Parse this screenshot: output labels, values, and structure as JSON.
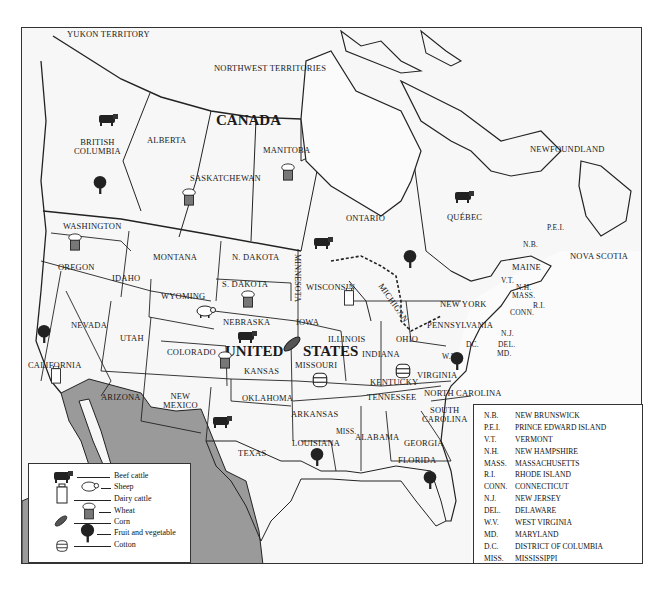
{
  "map": {
    "title": "North America agricultural products map",
    "country_labels": {
      "canada": "CANADA",
      "united": "UNITED",
      "states": "STATES"
    },
    "canada_regions": {
      "yukon": "YUKON\nTERRITORY",
      "nwt": "NORTHWEST TERRITORIES",
      "bc": "BRITISH\nCOLUMBIA",
      "alberta": "ALBERTA",
      "saskatchewan": "SASKATCHEWAN",
      "manitoba": "MANITOBA",
      "ontario": "ONTARIO",
      "quebec": "QUÉBEC",
      "newfoundland": "NEWFOUNDLAND",
      "nb": "N.B.",
      "pei": "P.E.I.",
      "nova_scotia": "NOVA SCOTIA"
    },
    "us_states": {
      "washington": "WASHINGTON",
      "oregon": "OREGON",
      "idaho": "IDAHO",
      "montana": "MONTANA",
      "ndakota": "N. DAKOTA",
      "sdakota": "S. DAKOTA",
      "minnesota": "MINNESOTA",
      "wisconsin": "WISCONSIN",
      "michigan": "MICHIGAN",
      "wyoming": "WYOMING",
      "nebraska": "NEBRASKA",
      "iowa": "IOWA",
      "illinois": "ILLINOIS",
      "indiana": "INDIANA",
      "ohio": "OHIO",
      "pennsylvania": "PENNSYLVANIA",
      "newyork": "NEW YORK",
      "maine": "MAINE",
      "vt": "V.T.",
      "nh": "N.H.",
      "mass": "MASS.",
      "ri": "R.I.",
      "conn": "CONN.",
      "nj": "N.J.",
      "del": "DEL.",
      "md": "MD.",
      "dc": "DC.",
      "wv": "W.V.",
      "virginia": "VIRGINIA",
      "kentucky": "KENTUCKY",
      "tennessee": "TENNESSEE",
      "ncarolina": "NORTH CAROLINA",
      "scarolina": "SOUTH\nCAROLINA",
      "georgia": "GEORGIA",
      "florida": "FLORIDA",
      "alabama": "ALABAMA",
      "miss": "MISS.",
      "louisiana": "LOUISIANA",
      "arkansas": "ARKANSAS",
      "missouri": "MISSOURI",
      "kansas": "KANSAS",
      "oklahoma": "OKLAHOMA",
      "texas": "TEXAS",
      "colorado": "COLORADO",
      "utah": "UTAH",
      "nevada": "NEVADA",
      "california": "CALIFORNIA",
      "arizona": "ARIZONA",
      "newmexico": "NEW\nMEXICO"
    },
    "colors": {
      "land": "#f7f7f7",
      "mexico": "#9a9a9a",
      "border": "#222222",
      "frame": "#333333"
    }
  },
  "legend": {
    "items": [
      {
        "icon": "beef-cattle-icon",
        "label": "Beef cattle"
      },
      {
        "icon": "sheep-icon",
        "label": "Sheep"
      },
      {
        "icon": "dairy-cattle-icon",
        "label": "Dairy cattle"
      },
      {
        "icon": "wheat-icon",
        "label": "Wheat"
      },
      {
        "icon": "corn-icon",
        "label": "Corn"
      },
      {
        "icon": "fruit-vegetable-icon",
        "label": "Fruit and vegetable"
      },
      {
        "icon": "cotton-icon",
        "label": "Cotton"
      }
    ]
  },
  "abbreviations": [
    {
      "abbr": "N.B.",
      "name": "NEW BRUNSWICK"
    },
    {
      "abbr": "P.E.I.",
      "name": "PRINCE EDWARD ISLAND"
    },
    {
      "abbr": "V.T.",
      "name": "VERMONT"
    },
    {
      "abbr": "N.H.",
      "name": "NEW HAMPSHIRE"
    },
    {
      "abbr": "MASS.",
      "name": "MASSACHUSETTS"
    },
    {
      "abbr": "R.I.",
      "name": "RHODE ISLAND"
    },
    {
      "abbr": "CONN.",
      "name": "CONNECTICUT"
    },
    {
      "abbr": "N.J.",
      "name": "NEW JERSEY"
    },
    {
      "abbr": "DEL.",
      "name": "DELAWARE"
    },
    {
      "abbr": "W.V.",
      "name": "WEST VIRGINIA"
    },
    {
      "abbr": "MD.",
      "name": "MARYLAND"
    },
    {
      "abbr": "D.C.",
      "name": "DISTRICT OF COLUMBIA"
    },
    {
      "abbr": "MISS.",
      "name": "MISSISSIPPI"
    }
  ],
  "product_markers": [
    {
      "type": "beef-cattle",
      "region": "British Columbia"
    },
    {
      "type": "fruit-vegetable",
      "region": "British Columbia"
    },
    {
      "type": "wheat",
      "region": "Saskatchewan"
    },
    {
      "type": "wheat",
      "region": "Manitoba"
    },
    {
      "type": "beef-cattle",
      "region": "Ontario"
    },
    {
      "type": "fruit-vegetable",
      "region": "Ontario"
    },
    {
      "type": "beef-cattle",
      "region": "Québec"
    },
    {
      "type": "wheat",
      "region": "Washington"
    },
    {
      "type": "dairy-cattle",
      "region": "Wisconsin"
    },
    {
      "type": "wheat",
      "region": "S. Dakota"
    },
    {
      "type": "sheep",
      "region": "Wyoming"
    },
    {
      "type": "beef-cattle",
      "region": "Nebraska"
    },
    {
      "type": "corn",
      "region": "Iowa"
    },
    {
      "type": "wheat",
      "region": "Kansas"
    },
    {
      "type": "fruit-vegetable",
      "region": "California"
    },
    {
      "type": "dairy-cattle",
      "region": "California"
    },
    {
      "type": "cotton",
      "region": "Missouri"
    },
    {
      "type": "cotton",
      "region": "Kentucky"
    },
    {
      "type": "fruit-vegetable",
      "region": "Virginia"
    },
    {
      "type": "beef-cattle",
      "region": "Texas"
    },
    {
      "type": "fruit-vegetable",
      "region": "Louisiana"
    },
    {
      "type": "fruit-vegetable",
      "region": "Florida"
    }
  ]
}
